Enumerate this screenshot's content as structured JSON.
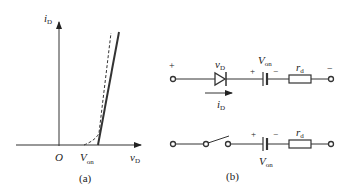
{
  "figure_a": {
    "caption": "(a)",
    "y_axis_label_main": "i",
    "y_axis_label_sub": "D",
    "x_axis_label_main": "v",
    "x_axis_label_sub": "D",
    "origin_label": "O",
    "von_label_main": "V",
    "von_label_sub": "on",
    "curves": [
      {
        "name": "piecewise-linear model",
        "style": "solid"
      },
      {
        "name": "actual diode characteristic",
        "style": "dashed"
      }
    ]
  },
  "figure_b": {
    "caption": "(b)",
    "top_circuit": {
      "plus_left": "+",
      "minus_right": "−",
      "diode_label_main": "v",
      "diode_label_sub": "D",
      "current_label_main": "i",
      "current_label_sub": "D",
      "source_label_main": "V",
      "source_label_sub": "on",
      "source_plus": "+",
      "source_minus": "−",
      "resistor_label_main": "r",
      "resistor_label_sub": "d"
    },
    "bottom_circuit": {
      "source_label_main": "V",
      "source_label_sub": "on",
      "source_plus": "+",
      "source_minus": "−",
      "resistor_label_main": "r",
      "resistor_label_sub": "d"
    }
  }
}
